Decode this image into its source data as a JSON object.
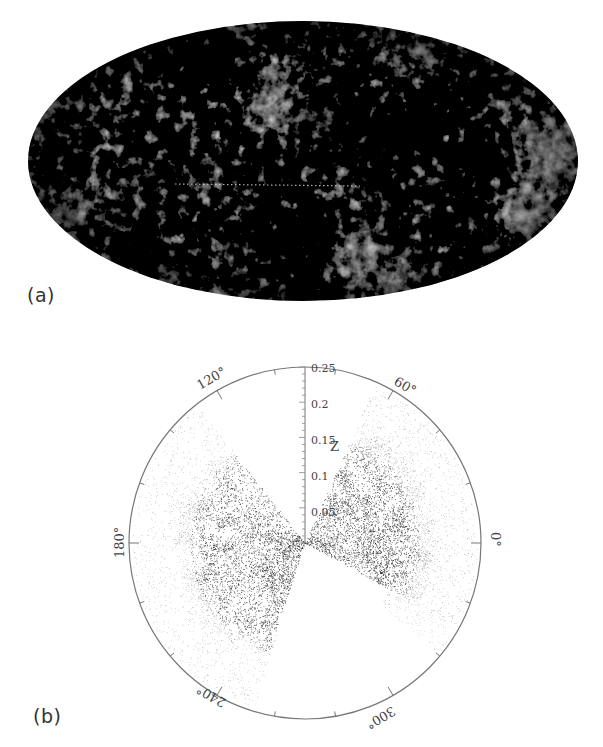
{
  "figure": {
    "panels": [
      {
        "label": "(a)",
        "kind": "all-sky Mollweide map",
        "description": "Full-sky temperature fluctuation map shown in grayscale on an elliptical (Mollweide) projection"
      },
      {
        "label": "(b)",
        "kind": "polar redshift wedge diagram",
        "radial_axis": {
          "label": "Z",
          "ticks": [
            "0.25",
            "0.2",
            "0.15",
            "0.1",
            "0.05",
            "0"
          ]
        },
        "angle_labels": [
          "60°",
          "120°",
          "180°",
          "240°",
          "300°",
          "0°"
        ]
      }
    ]
  },
  "chart_data": {
    "type": "scatter",
    "title": "",
    "projection": "polar",
    "radial_label": "Z",
    "radial_range": [
      0,
      0.25
    ],
    "radial_ticks": [
      0,
      0.05,
      0.1,
      0.15,
      0.2,
      0.25
    ],
    "angular_ticks_deg": [
      0,
      60,
      120,
      180,
      240,
      300
    ],
    "angular_tick_labels": [
      "0°",
      "60°",
      "120°",
      "180°",
      "240°",
      "300°"
    ],
    "series": [
      {
        "name": "left wedge galaxies",
        "angle_range_deg": [
          128,
          253
        ],
        "dense_angle_range_deg": [
          128,
          252
        ],
        "z_range": [
          0,
          0.25
        ]
      },
      {
        "name": "right wedge galaxies",
        "angle_range_deg": [
          -40,
          66
        ],
        "dense_angle_range_deg": [
          -29,
          66
        ],
        "z_range": [
          0,
          0.25
        ]
      }
    ],
    "grid": false
  }
}
